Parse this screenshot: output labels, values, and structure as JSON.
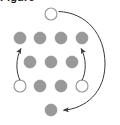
{
  "figure": {
    "caption_sliver": "Figure",
    "width": 120,
    "height": 125,
    "background_color": "#ffffff",
    "dot_fill_color": "#999999",
    "dot_stroke_color": "#8a8a8a",
    "hollow_fill_color": "#ffffff",
    "arrow_color": "#3a3a3a",
    "dot_radius": 6.0
  },
  "chart_data": {
    "type": "scatter",
    "title": "",
    "xlabel": "",
    "ylabel": "",
    "xlim": [
      0,
      120
    ],
    "ylim": [
      0,
      125
    ],
    "grid": false,
    "legend": false,
    "series": [
      {
        "name": "filled-nodes",
        "marker": "filled-circle",
        "color": "#999999",
        "points": [
          {
            "id": "r1c1",
            "x": 20,
            "y": 38
          },
          {
            "id": "r1c2",
            "x": 40,
            "y": 38
          },
          {
            "id": "r1c3",
            "x": 61,
            "y": 38
          },
          {
            "id": "r1c4",
            "x": 82,
            "y": 38
          },
          {
            "id": "r2c1",
            "x": 30,
            "y": 62
          },
          {
            "id": "r2c2",
            "x": 51,
            "y": 62
          },
          {
            "id": "r2c3",
            "x": 72,
            "y": 62
          },
          {
            "id": "r3c2",
            "x": 40,
            "y": 86
          },
          {
            "id": "r3c3",
            "x": 61,
            "y": 86
          },
          {
            "id": "r4c1",
            "x": 51,
            "y": 110
          }
        ]
      },
      {
        "name": "hollow-nodes",
        "marker": "open-circle",
        "color": "#ffffff",
        "points": [
          {
            "id": "top",
            "x": 51,
            "y": 14
          },
          {
            "id": "r3c1",
            "x": 20,
            "y": 86
          },
          {
            "id": "r3c4",
            "x": 82,
            "y": 86
          }
        ]
      }
    ],
    "annotations": [
      {
        "type": "curved-arrow",
        "name": "left-inner-arrow",
        "from": {
          "x": 20,
          "y": 80
        },
        "to": {
          "x": 22,
          "y": 46
        },
        "direction": "upward",
        "arrowhead": "end"
      },
      {
        "type": "curved-arrow",
        "name": "right-inner-arrow",
        "from": {
          "x": 82,
          "y": 80
        },
        "to": {
          "x": 80,
          "y": 46
        },
        "direction": "upward",
        "arrowhead": "end"
      },
      {
        "type": "curved-arrow",
        "name": "outer-wrap-arrow",
        "from": {
          "x": 58,
          "y": 12
        },
        "to": {
          "x": 60,
          "y": 110
        },
        "direction": "clockwise-around-right",
        "arrowhead": "end"
      }
    ]
  }
}
